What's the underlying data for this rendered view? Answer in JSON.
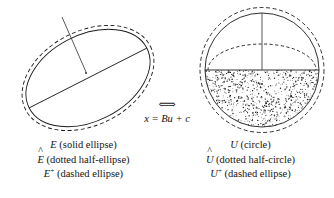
{
  "figure": {
    "title_visible": false,
    "relation": {
      "arrow_symbol": "⟺",
      "equation": "x = Bu + c"
    },
    "left_panel": {
      "name": "transformed-ellipse-diagram",
      "caption_lines": [
        {
          "symbol": "E",
          "accent": "none",
          "superscript": "",
          "description": "(solid ellipse)"
        },
        {
          "symbol": "E",
          "accent": "hat",
          "superscript": "",
          "description": "(dotted half-ellipse)"
        },
        {
          "symbol": "E",
          "accent": "none",
          "superscript": "+",
          "description": "(dashed ellipse)"
        }
      ],
      "caption_text": [
        "E (solid ellipse)",
        "Ê (dotted half-ellipse)",
        "E+ (dashed ellipse)"
      ]
    },
    "right_panel": {
      "name": "unit-circle-diagram",
      "caption_lines": [
        {
          "symbol": "U",
          "accent": "none",
          "superscript": "",
          "description": "(circle)"
        },
        {
          "symbol": "U",
          "accent": "hat",
          "superscript": "",
          "description": "(dotted half-circle)"
        },
        {
          "symbol": "U",
          "accent": "none",
          "superscript": "+",
          "description": "(dashed ellipse)"
        }
      ],
      "caption_text": [
        "U (circle)",
        "Û (dotted half-circle)",
        "U+ (dashed ellipse)"
      ]
    },
    "colors": {
      "ink": "#1a1a1a",
      "background": "#ffffff",
      "axis": "#3a3a3a"
    }
  },
  "chart_data": {
    "type": "scatter",
    "title": "",
    "xlabel": "",
    "ylabel": "",
    "panels": [
      {
        "name": "E",
        "center": [
          148,
          118
        ],
        "geometry": {
          "solid_ellipse": {
            "rx": 92,
            "ry": 46,
            "rotation_deg": -27
          },
          "dashed_ellipse": {
            "rx": 97,
            "ry": 52,
            "rotation_deg": -27
          },
          "dotted_half_ellipse": {
            "rx": 78,
            "ry": 26,
            "rotation_deg": -27,
            "half": "upper"
          },
          "chord": {
            "from": [
              -92,
              0
            ],
            "to": [
              92,
              0
            ],
            "rotation_deg": -27
          },
          "axis_segment": {
            "from": [
              0,
              0
            ],
            "to": [
              -20,
              -62
            ],
            "rotation_deg": -27
          },
          "shaded_half": "lower"
        }
      },
      {
        "name": "U",
        "center": [
          262,
          70
        ],
        "geometry": {
          "solid_circle": {
            "r": 58
          },
          "dashed_ellipse": {
            "rx": 62,
            "ry": 63,
            "rotation_deg": 0
          },
          "dotted_half_ellipse": {
            "rx": 56,
            "ry": 27,
            "rotation_deg": 0,
            "half": "upper"
          },
          "chord": {
            "from": [
              -58,
              0
            ],
            "to": [
              58,
              0
            ]
          },
          "axis_segment": {
            "from": [
              0,
              0
            ],
            "to": [
              0,
              -58
            ]
          },
          "shaded_half": "lower"
        }
      }
    ]
  }
}
